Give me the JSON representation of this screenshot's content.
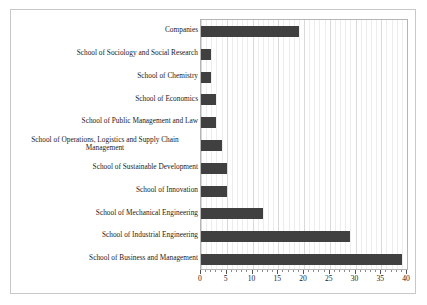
{
  "chart_data": {
    "type": "bar",
    "orientation": "horizontal",
    "title": "",
    "xlabel": "",
    "ylabel": "",
    "xlim": [
      0,
      40
    ],
    "xticks": [
      0,
      5,
      10,
      15,
      20,
      25,
      30,
      35,
      40
    ],
    "minor_tick_step": 1,
    "grid": true,
    "grid_axis": "x",
    "legend": "none",
    "bar_color": "#404040",
    "categories": [
      "Companies",
      "School of Sociology and Social Research",
      "School of Chemistry",
      "School of Economics",
      "School of Public Management and Law",
      "School of Operations, Logistics and Supply Chain Management",
      "School of Sustainable Development",
      "School of Innovation",
      "School of Mechanical Engineering",
      "School of Industrial Engineering",
      "School of Business and Management"
    ],
    "values": [
      19,
      2,
      2,
      3,
      3,
      4,
      5,
      5,
      12,
      29,
      39
    ]
  },
  "colors": {
    "bar": "#404040",
    "frame": "#c8c8c8",
    "plot_border": "#b5b5b5",
    "gridline_minor": "#ededed",
    "gridline_major": "#d9d9d9",
    "text": "#1a1a1a",
    "background": "#ffffff"
  }
}
